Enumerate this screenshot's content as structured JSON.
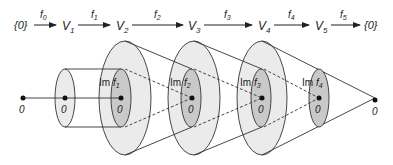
{
  "sequence": {
    "nodes": [
      "{0}",
      "V",
      "V",
      "V",
      "V",
      "V",
      "{0}"
    ],
    "node_subscripts": [
      "",
      "1",
      "2",
      "3",
      "4",
      "5",
      ""
    ],
    "maps": [
      {
        "name": "f",
        "sub": "0"
      },
      {
        "name": "f",
        "sub": "1"
      },
      {
        "name": "f",
        "sub": "2"
      },
      {
        "name": "f",
        "sub": "3"
      },
      {
        "name": "f",
        "sub": "4"
      },
      {
        "name": "f",
        "sub": "5"
      }
    ]
  },
  "diagram": {
    "zero_label": "0",
    "image_labels": [
      {
        "prefix": "Im ",
        "f": "f",
        "sub": "1"
      },
      {
        "prefix": "Im ",
        "f": "f",
        "sub": "2"
      },
      {
        "prefix": "Im ",
        "f": "f",
        "sub": "3"
      },
      {
        "prefix": "Im ",
        "f": "f",
        "sub": "4"
      }
    ]
  },
  "colors": {
    "outer_fill": "#ebebeb",
    "inner_fill": "#c9c9c9",
    "stroke": "#333333"
  }
}
